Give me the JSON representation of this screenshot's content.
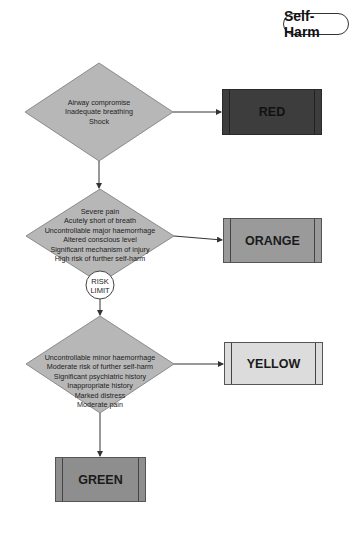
{
  "title": "Self-Harm",
  "colors": {
    "diamond_fill": "#b7b7b7",
    "red": "#3d3d3d",
    "orange": "#9a9a9a",
    "yellow": "#dcdcdc",
    "green": "#8e8e8e",
    "line": "#333333"
  },
  "decisions": [
    {
      "lines": [
        "Airway compromise",
        "Inadequate breathing",
        "Shock"
      ]
    },
    {
      "lines": [
        "Severe pain",
        "Acutely short of breath",
        "Uncontrollable major haemorrhage",
        "Altered conscious level",
        "Significant mechanism of injury",
        "High risk of further self-harm"
      ]
    },
    {
      "lines": [
        "Uncontrollable minor haemorrhage",
        "Moderate risk of further self-harm",
        "Significant psychiatric history",
        "Inappropriate history",
        "Marked distress",
        "Moderate pain"
      ]
    }
  ],
  "outcomes": {
    "red": "RED",
    "orange": "ORANGE",
    "yellow": "YELLOW",
    "green": "GREEN"
  },
  "risk_limit": {
    "line1": "RISK",
    "line2": "LIMIT"
  }
}
